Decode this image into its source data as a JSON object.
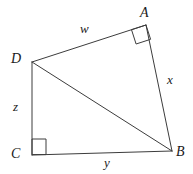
{
  "figure": {
    "kind": "geometry-diagram",
    "stroke_color": "#3c3c3c",
    "label_color": "#1a1a1a",
    "background_color": "#ffffff",
    "vertices": [
      {
        "id": "A",
        "label": "A",
        "x": 146,
        "y": 25
      },
      {
        "id": "B",
        "label": "B",
        "x": 172,
        "y": 151
      },
      {
        "id": "C",
        "label": "C",
        "x": 32,
        "y": 155
      },
      {
        "id": "D",
        "label": "D",
        "x": 32,
        "y": 62
      }
    ],
    "segments": [
      {
        "id": "DA",
        "from": "D",
        "to": "A",
        "label": "w"
      },
      {
        "id": "AB",
        "from": "A",
        "to": "B",
        "label": "x"
      },
      {
        "id": "CB",
        "from": "C",
        "to": "B",
        "label": "y"
      },
      {
        "id": "DC",
        "from": "D",
        "to": "C",
        "label": "z"
      },
      {
        "id": "DB",
        "from": "D",
        "to": "B",
        "label": ""
      }
    ],
    "side_labels": {
      "w": "w",
      "x": "x",
      "y": "y",
      "z": "z"
    },
    "right_angles": [
      {
        "at": "A",
        "between": [
          "D",
          "B"
        ]
      },
      {
        "at": "C",
        "between": [
          "D",
          "B"
        ]
      }
    ]
  }
}
